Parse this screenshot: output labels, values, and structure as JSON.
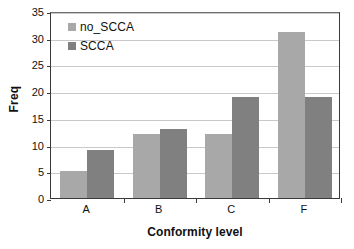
{
  "chart_data": {
    "type": "bar",
    "title": "",
    "subtitle": "",
    "xlabel": "Conformity level",
    "ylabel": "Freq",
    "categories": [
      "A",
      "B",
      "C",
      "F"
    ],
    "series": [
      {
        "name": "no_SCCA",
        "values": [
          5,
          12,
          12,
          31
        ],
        "color": "#a8a8a8"
      },
      {
        "name": "SCCA",
        "values": [
          9,
          13,
          19,
          19
        ],
        "color": "#808080"
      }
    ],
    "ylim": [
      0,
      35
    ],
    "ytick_values": [
      0,
      5,
      10,
      15,
      20,
      25,
      30,
      35
    ],
    "ytick_labels": [
      "0",
      "5",
      "10",
      "15",
      "20",
      "25",
      "30",
      "35"
    ],
    "grid": true,
    "grid_axis": "y",
    "legend_position": "upper-left-inside",
    "bar_grouping": "grouped",
    "background_color": "#ffffff",
    "axis_color": "#3a3a3a",
    "gridline_color": "#c9c9c9"
  }
}
